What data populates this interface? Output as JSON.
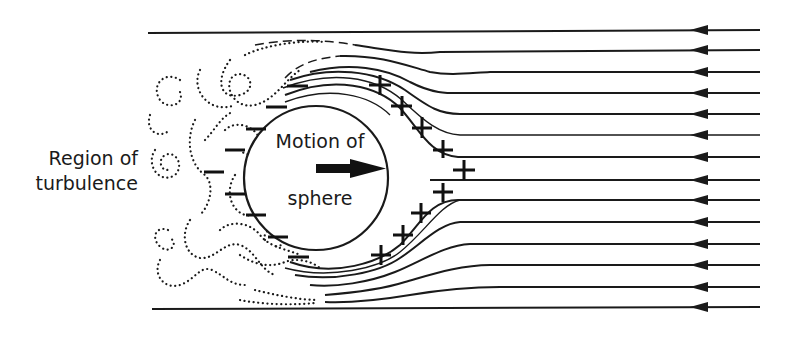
{
  "labels": {
    "region_of_turbulence": "Region of turbulence",
    "region_line1": "Region of",
    "region_line2": "turbulence",
    "motion_line1": "Motion of",
    "motion_line2": "sphere"
  },
  "diagram": {
    "sphere": {
      "cx": 316,
      "cy": 178,
      "r": 72
    },
    "motion_direction": "right",
    "airflow_direction": "left",
    "streamline_count": 14,
    "arrow_x": 703,
    "streamline_y": [
      33,
      50,
      72,
      93,
      114,
      135,
      157,
      180,
      200,
      222,
      244,
      265,
      287,
      309
    ],
    "positive_pressure_marks": 10,
    "negative_pressure_marks": 9,
    "symbols": {
      "positive": "+",
      "negative": "−"
    },
    "colors": {
      "ink": "#1a1a1a",
      "background": "#ffffff"
    }
  }
}
